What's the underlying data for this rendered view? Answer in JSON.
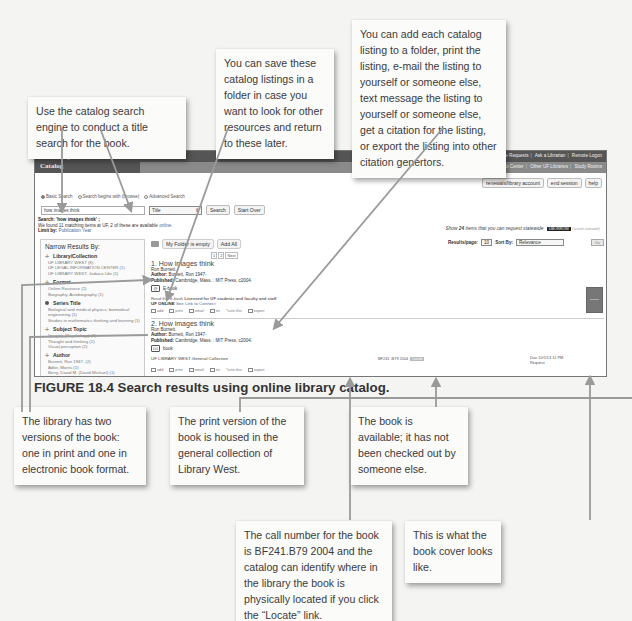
{
  "callouts": {
    "search_engine": "Use the catalog search engine to conduct a title search for the book.",
    "save_folder": "You can save these catalog listings in a folder in case you want to look for other resources and return to these later.",
    "actions": "You can add each catalog listing to a folder, print the listing, e-mail the listing to yourself or someone else, text message the listing to yourself or someone else, get a citation for the listing, or export the listing into other citation genertors.",
    "two_versions": "The library has two versions of the book: one in print and one in electronic book format.",
    "print_version": "The print version of the book is housed in the general collection of Library West.",
    "available": "The book is available; it has not been checked out by someone else.",
    "call_number": "The call number for the book is BF241.B79 2004 and the catalog can identify where in the library the book is physically located if you click the “Locate” link.",
    "cover": "This is what the book cover looks like."
  },
  "figure": {
    "label": "FIGURE 18.4",
    "caption": "Search results using online library catalog."
  },
  "catalog": {
    "brand_line1": "University of Florida Libraries",
    "brand_line2": "Catalog",
    "top_links": [
      "Journal Abbreviations",
      "Retrieval Help",
      "Online Requests",
      "Ask a Librarian",
      "Remote Logon"
    ],
    "sub_links": [
      "Smathers Libraries",
      "HSC Library",
      "Legal Info Center",
      "Other UF Libraries",
      "Study Rooms"
    ],
    "account_buttons": [
      "renewals/library account",
      "end session",
      "help"
    ],
    "search_modes": [
      "Basic Search",
      "Search begins with (browse)",
      "Advanced Search"
    ],
    "search": {
      "query": "how images think",
      "field": "Title",
      "search_button": "Search",
      "start_over_button": "Start Over"
    },
    "search_info": {
      "line1_label": "Search:",
      "line1_value": "'how images think' ;",
      "line2": "We found 11 matching items at UF, 2 of these are available",
      "line2_link": "online.",
      "line3_label": "Limit by:",
      "line3_link": "Publication Year"
    },
    "statewide": {
      "prefix": "Show",
      "count": "24",
      "suffix": "items that you can request statewide",
      "badge": "UBORROW",
      "small": "(search statewide)"
    },
    "sidebar": {
      "title": "Narrow Results By:",
      "facets": [
        {
          "title": "Library/Collection",
          "items": [
            "UF LIBRARY WEST (8)",
            "UF LEGAL INFORMATION CENTER (1)",
            "UF LIBRARY WEST, Judaica Libr (1)"
          ]
        },
        {
          "title": "Format",
          "items": [
            "Online Resource (2)",
            "Biography, Autobiography (1)"
          ]
        },
        {
          "title": "Series Title",
          "items": [
            "Biological and medical physics, biomedical engineering (1)",
            "Studies in mathematics thinking and learning (1)"
          ]
        },
        {
          "title": "Subject Topic",
          "items": [
            "Imagery (Psychology) (2)",
            "Thought and thinking (2)",
            "Visual perception (2)"
          ]
        },
        {
          "title": "Author",
          "items": [
            "Burnett, Ron 1947- (2)",
            "Adler, Morris (1)",
            "Berry, David M. (David Michael) (1)"
          ]
        }
      ]
    },
    "folder": {
      "status": "My Folder is empty",
      "add_all": "Add All"
    },
    "controls": {
      "results_per_page_label": "Results/page:",
      "results_per_page": "10",
      "sort_label": "Sort By:",
      "sort_value": "Relevance",
      "go": "Go"
    },
    "pager": [
      "1",
      "2",
      "Next"
    ],
    "results": [
      {
        "title": "1. How images think",
        "author_short": "Ron Burnett.",
        "author_label": "Author:",
        "author": "Burnett, Ron 1947-",
        "published_label": "Published:",
        "published": "Cambridge, Mass. : MIT Press, c2004.",
        "format": "E-book",
        "note": "Read this E-book",
        "note_bold": "Licensed for UF students and faculty and staff",
        "online": "UF ONLINE",
        "online_link": "See Link to Connect"
      },
      {
        "title": "2. How images think",
        "author_short": "Ron Burnett.",
        "author_label": "Author:",
        "author": "Burnett, Ron 1947-",
        "published_label": "Published:",
        "published": "Cambridge, Mass. : MIT Press, c2004.",
        "format": "book",
        "location": "UF LIBRARY WEST General Collection",
        "call_number": "BF241 .B79 2004",
        "locate": "Locate",
        "due": "Due 10/1/13 11 PM",
        "request": "Request"
      }
    ],
    "actions": [
      "add",
      "print",
      "email",
      "txt",
      "cite this",
      "export"
    ]
  }
}
